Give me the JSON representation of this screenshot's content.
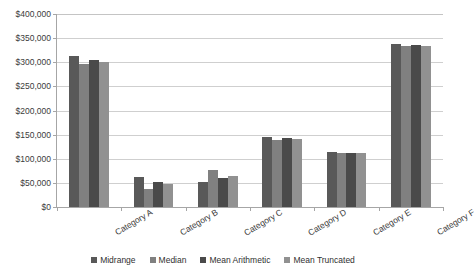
{
  "chart_data": {
    "type": "bar",
    "title": "",
    "subtitle": "",
    "xlabel": "",
    "ylabel": "",
    "grid": true,
    "legend_position": "bottom",
    "ylim": [
      0,
      400000
    ],
    "ytick_labels": [
      "$400,000",
      "$350,000",
      "$300,000",
      "$250,000",
      "$200,000",
      "$150,000",
      "$100,000",
      "$50,000",
      "$0"
    ],
    "ytick_values": [
      400000,
      350000,
      300000,
      250000,
      200000,
      150000,
      100000,
      50000,
      0
    ],
    "categories": [
      "Category A",
      "Category B",
      "Category C",
      "Category D",
      "Category E",
      "Category F"
    ],
    "series": [
      {
        "name": "Midrange",
        "color": "#595959",
        "values": [
          313000,
          62000,
          51000,
          146000,
          113000,
          338000
        ]
      },
      {
        "name": "Median",
        "color": "#808080",
        "values": [
          296000,
          38000,
          77000,
          139000,
          111000,
          334000
        ]
      },
      {
        "name": "Mean Arithmetic",
        "color": "#4a4a4a",
        "values": [
          304000,
          52000,
          60000,
          143000,
          112000,
          335000
        ]
      },
      {
        "name": "Mean Truncated",
        "color": "#919191",
        "values": [
          301000,
          47000,
          64000,
          141000,
          112000,
          333000
        ]
      }
    ]
  },
  "legend": {
    "items": [
      {
        "label": "Midrange",
        "color": "#595959"
      },
      {
        "label": "Median",
        "color": "#808080"
      },
      {
        "label": "Mean Arithmetic",
        "color": "#4a4a4a"
      },
      {
        "label": "Mean Truncated",
        "color": "#919191"
      }
    ]
  },
  "axis_colors": {
    "gridline": "#cfcfcf",
    "axis_line": "#a6a6a6",
    "text": "#3b3b3b"
  }
}
